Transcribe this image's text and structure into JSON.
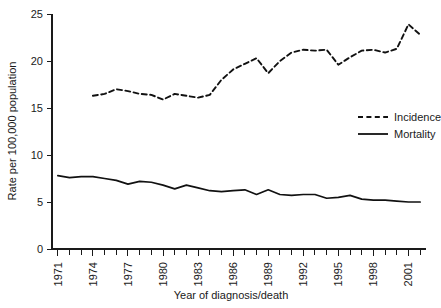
{
  "chart_data": {
    "type": "line",
    "title": "",
    "xlabel": "Year of diagnosis/death",
    "ylabel": "Rate per 100,000 population",
    "xlim": [
      1970.5,
      2002.5
    ],
    "ylim": [
      0,
      25
    ],
    "grid": false,
    "legend_position": "right-middle",
    "yticks": [
      0,
      5,
      10,
      15,
      20,
      25
    ],
    "ytick_labels": [
      "0",
      "5",
      "10",
      "15",
      "20",
      "25"
    ],
    "xticks": [
      1971,
      1974,
      1977,
      1980,
      1983,
      1986,
      1989,
      1992,
      1995,
      1998,
      2001
    ],
    "xtick_labels": [
      "1971",
      "1974",
      "1977",
      "1980",
      "1983",
      "1986",
      "1989",
      "1992",
      "1995",
      "1998",
      "2001"
    ],
    "xtick_minor": [
      1972,
      1973,
      1975,
      1976,
      1978,
      1979,
      1981,
      1982,
      1984,
      1985,
      1987,
      1988,
      1990,
      1991,
      1993,
      1994,
      1996,
      1997,
      1999,
      2000,
      2002
    ],
    "series": [
      {
        "name": "Incidence",
        "style": "dashed",
        "color": "#111111",
        "x": [
          1974,
          1975,
          1976,
          1977,
          1978,
          1979,
          1980,
          1981,
          1982,
          1983,
          1984,
          1985,
          1986,
          1987,
          1988,
          1989,
          1990,
          1991,
          1992,
          1993,
          1994,
          1995,
          1996,
          1997,
          1998,
          1999,
          2000,
          2001,
          2002
        ],
        "values": [
          16.3,
          16.5,
          17.0,
          16.8,
          16.5,
          16.4,
          15.9,
          16.5,
          16.3,
          16.1,
          16.4,
          18.0,
          19.1,
          19.7,
          20.3,
          18.7,
          20.0,
          20.9,
          21.2,
          21.1,
          21.2,
          19.6,
          20.4,
          21.1,
          21.2,
          20.9,
          21.3,
          23.9,
          22.8
        ]
      },
      {
        "name": "Mortality",
        "style": "solid",
        "color": "#111111",
        "x": [
          1971,
          1972,
          1973,
          1974,
          1975,
          1976,
          1977,
          1978,
          1979,
          1980,
          1981,
          1982,
          1983,
          1984,
          1985,
          1986,
          1987,
          1988,
          1989,
          1990,
          1991,
          1992,
          1993,
          1994,
          1995,
          1996,
          1997,
          1998,
          1999,
          2000,
          2001,
          2002
        ],
        "values": [
          7.8,
          7.6,
          7.7,
          7.7,
          7.5,
          7.3,
          6.9,
          7.2,
          7.1,
          6.8,
          6.4,
          6.8,
          6.5,
          6.2,
          6.1,
          6.2,
          6.3,
          5.8,
          6.3,
          5.8,
          5.7,
          5.8,
          5.8,
          5.4,
          5.5,
          5.7,
          5.3,
          5.2,
          5.2,
          5.1,
          5.0,
          5.0
        ]
      }
    ],
    "legend": [
      {
        "label": "Incidence",
        "style": "dashed"
      },
      {
        "label": "Mortality",
        "style": "solid"
      }
    ]
  }
}
